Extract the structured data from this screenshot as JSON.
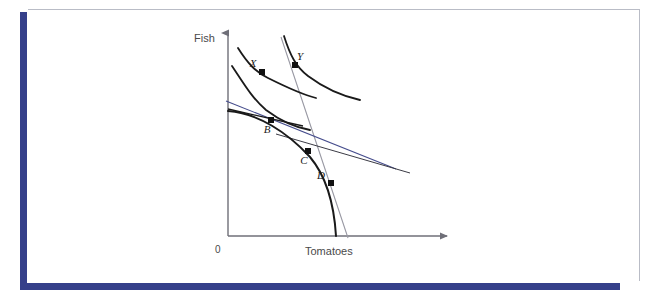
{
  "page": {
    "background_color": "#ffffff",
    "frame": {
      "navy_rule_color": "#35408a",
      "gray_rule_color": "#b9bcc6"
    }
  },
  "figure": {
    "name": "production-possibility-frontier-with-indifference-curves",
    "axes": {
      "y_label": "Fish",
      "x_label": "Tomatoes",
      "origin_label": "0",
      "axis_color": "#6f6f78",
      "origin_px": {
        "x": 228,
        "y": 236
      },
      "y_top_px": {
        "x": 228,
        "y": 33
      },
      "x_right_px": {
        "x": 447,
        "y": 236
      }
    },
    "points": [
      {
        "id": "X",
        "label": "X",
        "x_px": 262,
        "y_px": 72,
        "label_dx": -9,
        "label_dy": -5,
        "marker": "filled-square"
      },
      {
        "id": "Y",
        "label": "Y",
        "x_px": 295,
        "y_px": 65,
        "label_dx": 5,
        "label_dy": -5,
        "marker": "filled-square"
      },
      {
        "id": "B",
        "label": "B",
        "x_px": 271,
        "y_px": 120,
        "label_dx": -4,
        "label_dy": 13,
        "marker": "filled-square"
      },
      {
        "id": "C",
        "label": "C",
        "x_px": 308,
        "y_px": 151,
        "label_dx": -4,
        "label_dy": 13,
        "marker": "filled-square"
      },
      {
        "id": "D",
        "label": "D",
        "x_px": 331,
        "y_px": 183,
        "label_dx": -10,
        "label_dy": -4,
        "marker": "filled-square"
      }
    ],
    "curves": {
      "ppf": {
        "name": "production-possibility-frontier",
        "color": "#1a1a1a",
        "width": 2.0,
        "path": "M 228,111 C 258,113 288,133 310,157 C 326,176 334,203 336,236"
      },
      "indifference_low": {
        "name": "indifference-curve-through-X",
        "color": "#1a1a1a",
        "width": 1.8,
        "path": "M 238,48 C 248,64 256,72 268,78 C 284,86 300,94 316,98"
      },
      "indifference_high": {
        "name": "indifference-curve-through-Y",
        "color": "#1a1a1a",
        "width": 1.8,
        "path": "M 284,36 C 290,55 296,67 308,76 C 324,88 342,96 360,100"
      },
      "indifference_mid": {
        "name": "indifference-curve-through-B",
        "color": "#1a1a1a",
        "width": 1.8,
        "path": "M 232,66 C 244,84 252,98 266,110 C 282,122 298,128 310,130"
      }
    },
    "lines": {
      "price_line_steep_black": {
        "name": "price-line-steep",
        "color": "#1a1a1a",
        "width": 1.2,
        "x1": 223,
        "y1": 53,
        "x2": 393,
        "y2": 236
      },
      "price_line_gray": {
        "name": "price-line-gray",
        "color": "#9a9aa4",
        "width": 1.1,
        "x1": 281,
        "y1": 37,
        "x2": 348,
        "y2": 238
      },
      "budget_line_navy": {
        "name": "budget-line-navy",
        "color": "#454c8c",
        "width": 1.1,
        "x1": 226,
        "y1": 101,
        "x2": 396,
        "y2": 169
      },
      "tangent_at_b": {
        "name": "tangent-at-b",
        "color": "#1a1a1a",
        "width": 1.4,
        "x1": 228,
        "y1": 109,
        "x2": 303,
        "y2": 126
      },
      "tangent_at_c": {
        "name": "tangent-at-c",
        "color": "#3b3b45",
        "width": 1.0,
        "x1": 276,
        "y1": 134,
        "x2": 410,
        "y2": 173
      }
    }
  }
}
